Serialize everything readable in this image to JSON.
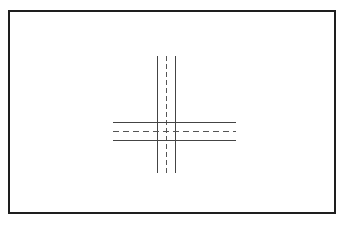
{
  "diagram": {
    "type": "road-intersection",
    "colors": {
      "frame": "#1e1e1e",
      "road_edge": "#444444",
      "center_line": "#555555",
      "background": "#ffffff"
    },
    "vertical_road": {
      "edges_x": [
        157,
        175
      ],
      "center_x": 166,
      "y_range": [
        56,
        173
      ]
    },
    "horizontal_road": {
      "edges_y": [
        122,
        140
      ],
      "center_y": 131,
      "x_range": [
        113,
        236
      ]
    }
  }
}
